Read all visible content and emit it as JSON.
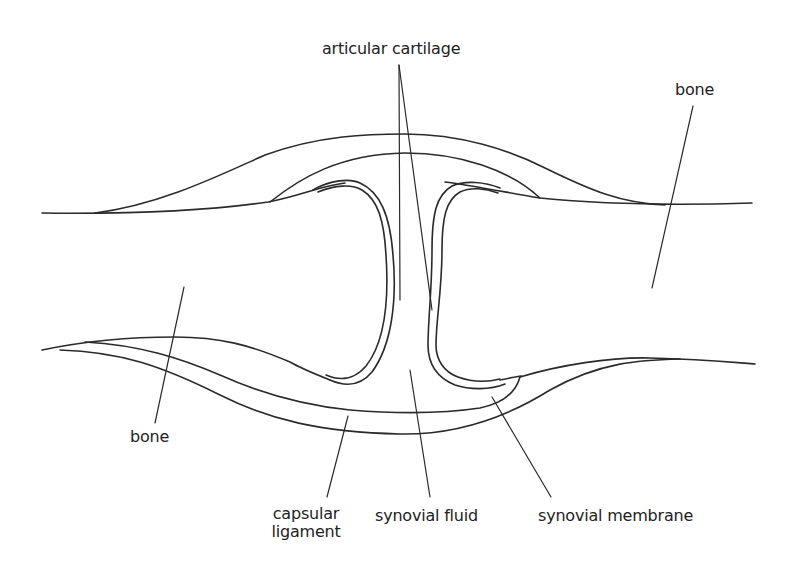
{
  "diagram": {
    "labels": {
      "articular_cartilage": "articular cartilage",
      "bone_right": "bone",
      "bone_left": "bone",
      "capsular_ligament_line1": "capsular",
      "capsular_ligament_line2": "ligament",
      "synovial_fluid": "synovial fluid",
      "synovial_membrane": "synovial membrane"
    },
    "colors": {
      "stroke": "#2a2a2a",
      "text": "#222222",
      "background": "#ffffff"
    }
  }
}
